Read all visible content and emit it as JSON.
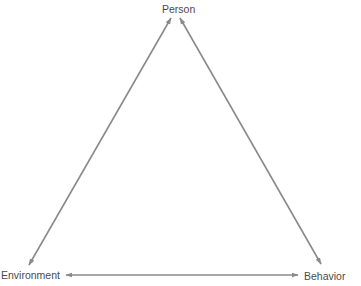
{
  "diagram": {
    "type": "triangle-reciprocal",
    "nodes": [
      {
        "id": "person",
        "label": "Person"
      },
      {
        "id": "environment",
        "label": "Environment"
      },
      {
        "id": "behavior",
        "label": "Behavior"
      }
    ],
    "edges": [
      {
        "from": "person",
        "to": "environment",
        "direction": "bidirectional"
      },
      {
        "from": "person",
        "to": "behavior",
        "direction": "bidirectional"
      },
      {
        "from": "environment",
        "to": "behavior",
        "direction": "bidirectional"
      }
    ],
    "colors": {
      "arrow": "#8a8a8a",
      "text": "#4a4a4a",
      "background": "#ffffff"
    }
  }
}
